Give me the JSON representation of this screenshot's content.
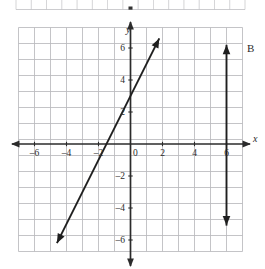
{
  "figure": {
    "label": "B",
    "top_strip": {
      "present": true,
      "cell_count": 15
    }
  },
  "axes": {
    "x_axis_name": "x",
    "y_axis_name": "y",
    "x_tick_labels": [
      "-6",
      "-4",
      "-2",
      "0",
      "2",
      "4",
      "6"
    ],
    "y_tick_labels": [
      "6",
      "4",
      "2",
      "-2",
      "-4",
      "-6"
    ],
    "origin_label": "0"
  },
  "chart_data": {
    "type": "line",
    "title": "",
    "xlabel": "x",
    "ylabel": "y",
    "xlim": [
      -7,
      7
    ],
    "ylim": [
      -7,
      7
    ],
    "grid": true,
    "grid_step": 1,
    "legend": "none",
    "xticks": [
      -6,
      -4,
      -2,
      0,
      2,
      4,
      6
    ],
    "yticks": [
      6,
      4,
      2,
      0,
      -2,
      -4,
      -6
    ],
    "annotations": [
      {
        "text": "B",
        "x": 7.2,
        "y": 6.0
      }
    ],
    "series": [
      {
        "name": "diagonal-line",
        "equation": "y = 2x + 3",
        "slope": 2,
        "y_intercept": 3,
        "x_intercept": -1.5,
        "arrows": "both",
        "points": [
          [
            -4.6,
            -6.2
          ],
          [
            1.8,
            6.6
          ]
        ]
      },
      {
        "name": "vertical-line",
        "equation": "x = 6",
        "arrows": "both",
        "points": [
          [
            6,
            6.2
          ],
          [
            6,
            -5.1
          ]
        ]
      }
    ]
  },
  "colors": {
    "grid": "#b9b9bd",
    "axis": "#2b2b2b",
    "plot_line": "#1f1f1f",
    "background": "#ffffff",
    "text": "#2b2b2b"
  }
}
